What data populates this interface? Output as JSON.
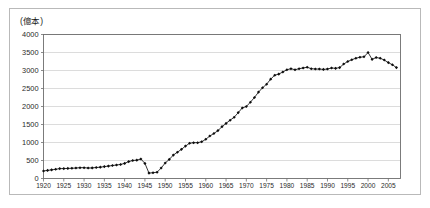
{
  "figure": {
    "unit_label": "(億本)",
    "background_color": "#ffffff",
    "frame_color": "#b9b9b9"
  },
  "chart_data": {
    "type": "line",
    "title": "",
    "subtitle": "",
    "xlabel": "",
    "ylabel": "(億本)",
    "xlim": [
      1920,
      2008
    ],
    "ylim": [
      0,
      4000
    ],
    "grid": true,
    "legend": "none",
    "marker": "filled-diamond",
    "line_color": "#111111",
    "marker_color": "#0d0d0d",
    "y_ticks": [
      0,
      500,
      1000,
      1500,
      2000,
      2500,
      3000,
      3500,
      4000
    ],
    "y_tick_labels": [
      "0",
      "500",
      "1000",
      "1500",
      "2000",
      "2500",
      "3000",
      "3500",
      "4000"
    ],
    "x_ticks": [
      1920,
      1925,
      1930,
      1935,
      1940,
      1945,
      1950,
      1955,
      1960,
      1965,
      1970,
      1975,
      1980,
      1985,
      1990,
      1995,
      2000,
      2005
    ],
    "x_tick_labels": [
      "1920",
      "1925",
      "1930",
      "1935",
      "1940",
      "1945",
      "1950",
      "1955",
      "1960",
      "1965",
      "1970",
      "1975",
      "1980",
      "1985",
      "1990",
      "1995",
      "2000",
      "2005"
    ],
    "x": [
      1920,
      1921,
      1922,
      1923,
      1924,
      1925,
      1926,
      1927,
      1928,
      1929,
      1930,
      1931,
      1932,
      1933,
      1934,
      1935,
      1936,
      1937,
      1938,
      1939,
      1940,
      1941,
      1942,
      1943,
      1944,
      1945,
      1946,
      1947,
      1948,
      1949,
      1950,
      1951,
      1952,
      1953,
      1954,
      1955,
      1956,
      1957,
      1958,
      1959,
      1960,
      1961,
      1962,
      1963,
      1964,
      1965,
      1966,
      1967,
      1968,
      1969,
      1970,
      1971,
      1972,
      1973,
      1974,
      1975,
      1976,
      1977,
      1978,
      1979,
      1980,
      1981,
      1982,
      1983,
      1984,
      1985,
      1986,
      1987,
      1988,
      1989,
      1990,
      1991,
      1992,
      1993,
      1994,
      1995,
      1996,
      1997,
      1998,
      1999,
      2000,
      2001,
      2002,
      2003,
      2004,
      2005,
      2006,
      2007
    ],
    "y": [
      210,
      225,
      240,
      255,
      275,
      275,
      280,
      285,
      290,
      300,
      300,
      290,
      295,
      305,
      315,
      330,
      345,
      360,
      375,
      390,
      420,
      470,
      500,
      510,
      540,
      420,
      150,
      160,
      175,
      290,
      430,
      530,
      650,
      730,
      810,
      900,
      980,
      995,
      995,
      1020,
      1090,
      1180,
      1250,
      1330,
      1440,
      1530,
      1620,
      1700,
      1830,
      1960,
      2000,
      2120,
      2250,
      2400,
      2520,
      2620,
      2760,
      2870,
      2900,
      2960,
      3020,
      3050,
      3020,
      3050,
      3070,
      3090,
      3050,
      3040,
      3040,
      3030,
      3040,
      3070,
      3060,
      3080,
      3180,
      3250,
      3300,
      3340,
      3370,
      3380,
      3500,
      3310,
      3360,
      3340,
      3290,
      3220,
      3160,
      3080,
      2950,
      2840,
      2690,
      2590
    ]
  }
}
